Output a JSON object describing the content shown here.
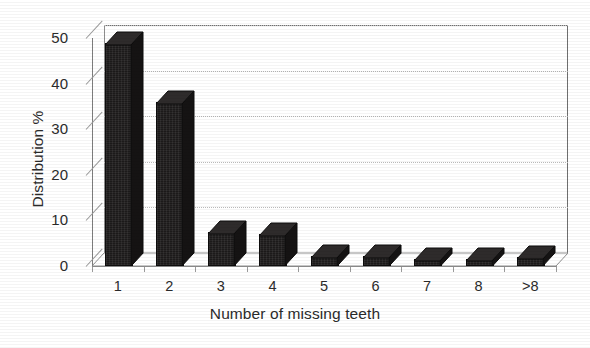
{
  "chart_data": {
    "type": "bar",
    "title": "",
    "xlabel": "Number of missing teeth",
    "ylabel": "Distribution %",
    "categories": [
      "1",
      "2",
      "3",
      "4",
      "5",
      "6",
      "7",
      "8",
      ">8"
    ],
    "values": [
      48.5,
      35.5,
      7.0,
      6.5,
      1.8,
      1.8,
      1.2,
      1.2,
      1.5
    ],
    "ylim": [
      0,
      50
    ],
    "yticks": [
      0,
      10,
      20,
      30,
      40,
      50
    ],
    "ytick_labels": [
      "0",
      "10",
      "20",
      "30",
      "40",
      "50"
    ],
    "grid": true,
    "grid_axis": "y",
    "legend": false,
    "legend_position": "none",
    "style": "3d-column",
    "bar_color": "#1c1a1a",
    "grid_color": "#b9b9b9",
    "axis_color": "#7d7d7d",
    "background": "#ffffff",
    "text_color": "#2b2b2b"
  }
}
